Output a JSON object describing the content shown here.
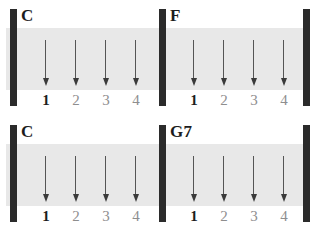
{
  "sheet": {
    "title": "strumming-pattern-chart",
    "beats_per_measure": 4,
    "strum_direction": "down",
    "colors": {
      "band": "#e8e8e8",
      "barline": "#2b2b2b",
      "arrow": "#3a3a3a",
      "accent_text": "#1d1d1d",
      "muted_text": "#8e8e8e",
      "background": "#ffffff"
    },
    "systems": [
      {
        "name": "system-1",
        "measures": [
          {
            "name": "measure-1",
            "chord": "C",
            "beats": [
              {
                "number": "1",
                "accent": true,
                "strum": "down"
              },
              {
                "number": "2",
                "accent": false,
                "strum": "down"
              },
              {
                "number": "3",
                "accent": false,
                "strum": "down"
              },
              {
                "number": "4",
                "accent": false,
                "strum": "down"
              }
            ]
          },
          {
            "name": "measure-2",
            "chord": "F",
            "beats": [
              {
                "number": "1",
                "accent": true,
                "strum": "down"
              },
              {
                "number": "2",
                "accent": false,
                "strum": "down"
              },
              {
                "number": "3",
                "accent": false,
                "strum": "down"
              },
              {
                "number": "4",
                "accent": false,
                "strum": "down"
              }
            ]
          }
        ]
      },
      {
        "name": "system-2",
        "measures": [
          {
            "name": "measure-3",
            "chord": "C",
            "beats": [
              {
                "number": "1",
                "accent": true,
                "strum": "down"
              },
              {
                "number": "2",
                "accent": false,
                "strum": "down"
              },
              {
                "number": "3",
                "accent": false,
                "strum": "down"
              },
              {
                "number": "4",
                "accent": false,
                "strum": "down"
              }
            ]
          },
          {
            "name": "measure-4",
            "chord": "G7",
            "beats": [
              {
                "number": "1",
                "accent": true,
                "strum": "down"
              },
              {
                "number": "2",
                "accent": false,
                "strum": "down"
              },
              {
                "number": "3",
                "accent": false,
                "strum": "down"
              },
              {
                "number": "4",
                "accent": false,
                "strum": "down"
              }
            ]
          }
        ]
      }
    ]
  }
}
